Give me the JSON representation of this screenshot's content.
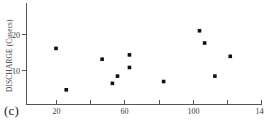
{
  "figure": {
    "caption": "(c)",
    "background_color": "#ffffff",
    "marker_color": "#111111",
    "axis_color": "#555555"
  },
  "chart_data": {
    "type": "scatter",
    "title": "",
    "xlabel": "",
    "ylabel": "DISCHARGE (Cusecs)",
    "xlim": [
      8,
      142
    ],
    "ylim": [
      0,
      26
    ],
    "grid": false,
    "legend": null,
    "x_ticks_major": [
      20,
      60,
      100,
      140
    ],
    "x_ticks_minor": [
      40,
      80,
      120
    ],
    "x_tick_labels": [
      "20",
      "60",
      "100",
      "140"
    ],
    "y_ticks_major": [
      10,
      20
    ],
    "y_tick_labels": [
      "10",
      "20"
    ],
    "marker": "filled-square",
    "points": [
      {
        "x": 20,
        "y": 16.0
      },
      {
        "x": 26,
        "y": 4.5
      },
      {
        "x": 47,
        "y": 13.0
      },
      {
        "x": 53,
        "y": 6.3
      },
      {
        "x": 56,
        "y": 8.3
      },
      {
        "x": 63,
        "y": 14.2
      },
      {
        "x": 63,
        "y": 10.7
      },
      {
        "x": 83,
        "y": 6.8
      },
      {
        "x": 104,
        "y": 20.9
      },
      {
        "x": 107,
        "y": 17.5
      },
      {
        "x": 113,
        "y": 8.3
      },
      {
        "x": 122,
        "y": 13.8
      }
    ]
  }
}
